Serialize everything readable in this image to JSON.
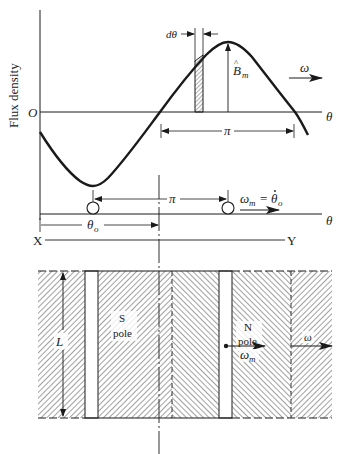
{
  "figure": {
    "colors": {
      "ink": "#1a1a1a",
      "background": "#ffffff"
    }
  },
  "flux_plot": {
    "y_axis_label": "Flux density",
    "origin_label": "O",
    "x_axis_label": "θ",
    "strip_label": "dθ",
    "peak_label_main": "B",
    "peak_label_hat": "^",
    "peak_label_sub": "m",
    "half_period_label": "π",
    "wave_speed_label": "ω"
  },
  "rotor_track": {
    "axis_label": "θ",
    "spacing_label": "π",
    "speed_label_main": "ω",
    "speed_label_sub": "m",
    "speed_label_eq": "=",
    "speed_label_theta": "θ",
    "speed_label_theta_sub": "o",
    "offset_label_main": "θ",
    "offset_label_sub": "o"
  },
  "section_line": {
    "left_label": "X",
    "right_label": "Y"
  },
  "pole_block": {
    "length_label": "L",
    "s_pole_line1": "S",
    "s_pole_line2": "pole",
    "n_pole_line1": "N",
    "n_pole_line2": "pole",
    "rotor_speed_main": "ω",
    "rotor_speed_sub": "m",
    "field_speed_label": "ω"
  }
}
